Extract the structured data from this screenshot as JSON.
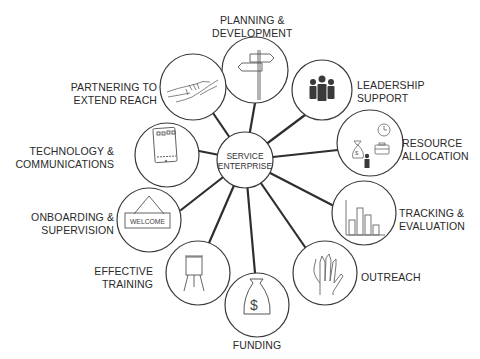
{
  "center": {
    "line1": "SERVICE",
    "line2": "ENTERPRISE"
  },
  "nodes": [
    {
      "id": "planning",
      "line1": "PLANNING &",
      "line2": "DEVELOPMENT",
      "icon": "signpost-icon"
    },
    {
      "id": "leadership",
      "line1": "LEADERSHIP",
      "line2": "SUPPORT",
      "icon": "people-group-icon"
    },
    {
      "id": "resource",
      "line1": "RESOURCE",
      "line2": "ALLOCATION",
      "icon": "resources-icon"
    },
    {
      "id": "tracking",
      "line1": "TRACKING &",
      "line2": "EVALUATION",
      "icon": "bar-chart-icon"
    },
    {
      "id": "outreach",
      "line1": "OUTREACH",
      "line2": "",
      "icon": "hand-icon"
    },
    {
      "id": "funding",
      "line1": "FUNDING",
      "line2": "",
      "icon": "money-bag-icon"
    },
    {
      "id": "training",
      "line1": "EFFECTIVE",
      "line2": "TRAINING",
      "icon": "flipchart-icon"
    },
    {
      "id": "onboarding",
      "line1": "ONBOARDING &",
      "line2": "SUPERVISION",
      "icon": "welcome-sign-icon",
      "sign_text": "WELCOME"
    },
    {
      "id": "technology",
      "line1": "TECHNOLOGY &",
      "line2": "COMMUNICATIONS",
      "icon": "tablet-icon"
    },
    {
      "id": "partnering",
      "line1": "PARTNERING TO",
      "line2": "EXTEND REACH",
      "icon": "handshake-icon"
    }
  ],
  "colors": {
    "stroke": "#3a3a3a",
    "line": "#2e2e2e",
    "text": "#2a2a2a",
    "background": "#ffffff"
  }
}
